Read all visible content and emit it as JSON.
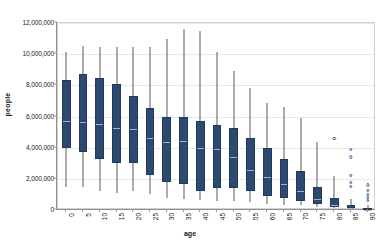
{
  "chart": {
    "type": "box",
    "title": "",
    "xlabel": "age",
    "ylabel": "people",
    "ylim": [
      0,
      12000000
    ],
    "ytick_labels": [
      "0",
      "2,000,000",
      "4,000,000",
      "6,000,000",
      "8,000,000",
      "10,000,000",
      "12,000,000"
    ],
    "ytick_values": [
      0,
      2000000,
      4000000,
      6000000,
      8000000,
      10000000,
      12000000
    ],
    "grid": true,
    "legend": "none",
    "box_color": "#2c4a70",
    "median_color": "#9fb2c8",
    "whisker_color": "#5b5b5b",
    "outlier_color": "#3a5f8a"
  },
  "chart_data": {
    "type": "box",
    "title": "",
    "xlabel": "age",
    "ylabel": "people",
    "ylim": [
      0,
      12000000
    ],
    "grid": true,
    "legend": "none",
    "categories": [
      "0",
      "5",
      "10",
      "15",
      "20",
      "25",
      "30",
      "35",
      "40",
      "45",
      "50",
      "55",
      "60",
      "65",
      "70",
      "75",
      "80",
      "85",
      "90"
    ],
    "boxes": [
      {
        "category": "0",
        "whisker_low": 1450000,
        "q1": 3950000,
        "median": 5750000,
        "q3": 8350000,
        "whisker_high": 10150000,
        "outliers": []
      },
      {
        "category": "5",
        "whisker_low": 1450000,
        "q1": 3700000,
        "median": 5700000,
        "q3": 8750000,
        "whisker_high": 10500000,
        "outliers": []
      },
      {
        "category": "10",
        "whisker_low": 1250000,
        "q1": 3300000,
        "median": 5600000,
        "q3": 8500000,
        "whisker_high": 10450000,
        "outliers": []
      },
      {
        "category": "15",
        "whisker_low": 1100000,
        "q1": 3000000,
        "median": 5300000,
        "q3": 8100000,
        "whisker_high": 10450000,
        "outliers": []
      },
      {
        "category": "20",
        "whisker_low": 1200000,
        "q1": 3000000,
        "median": 5250000,
        "q3": 7300000,
        "whisker_high": 10450000,
        "outliers": []
      },
      {
        "category": "25",
        "whisker_low": 1000000,
        "q1": 2250000,
        "median": 4700000,
        "q3": 6550000,
        "whisker_high": 10450000,
        "outliers": []
      },
      {
        "category": "30",
        "whisker_low": 800000,
        "q1": 1800000,
        "median": 4450000,
        "q3": 5950000,
        "whisker_high": 11000000,
        "outliers": []
      },
      {
        "category": "35",
        "whisker_low": 700000,
        "q1": 1650000,
        "median": 4500000,
        "q3": 6000000,
        "whisker_high": 11600000,
        "outliers": []
      },
      {
        "category": "40",
        "whisker_low": 650000,
        "q1": 1250000,
        "median": 4050000,
        "q3": 5700000,
        "whisker_high": 11500000,
        "outliers": []
      },
      {
        "category": "45",
        "whisker_low": 600000,
        "q1": 1400000,
        "median": 3950000,
        "q3": 5450000,
        "whisker_high": 10150000,
        "outliers": []
      },
      {
        "category": "50",
        "whisker_low": 550000,
        "q1": 1400000,
        "median": 3450000,
        "q3": 5250000,
        "whisker_high": 8900000,
        "outliers": []
      },
      {
        "category": "55",
        "whisker_low": 500000,
        "q1": 1200000,
        "median": 2650000,
        "q3": 4650000,
        "whisker_high": 7850000,
        "outliers": []
      },
      {
        "category": "60",
        "whisker_low": 400000,
        "q1": 900000,
        "median": 2200000,
        "q3": 4000000,
        "whisker_high": 6850000,
        "outliers": []
      },
      {
        "category": "65",
        "whisker_low": 350000,
        "q1": 750000,
        "median": 1750000,
        "q3": 3250000,
        "whisker_high": 6600000,
        "outliers": []
      },
      {
        "category": "70",
        "whisker_low": 300000,
        "q1": 600000,
        "median": 1300000,
        "q3": 2500000,
        "whisker_high": 5900000,
        "outliers": []
      },
      {
        "category": "75",
        "whisker_low": 200000,
        "q1": 400000,
        "median": 800000,
        "q3": 1450000,
        "whisker_high": 4350000,
        "outliers": []
      },
      {
        "category": "80",
        "whisker_low": 120000,
        "q1": 200000,
        "median": 400000,
        "q3": 750000,
        "whisker_high": 2200000,
        "outliers": [
          4600000
        ]
      },
      {
        "category": "85",
        "whisker_low": 60000,
        "q1": 100000,
        "median": 180000,
        "q3": 320000,
        "whisker_high": 700000,
        "outliers": [
          3900000,
          3400000,
          2200000,
          1750000,
          1500000
        ]
      },
      {
        "category": "90",
        "whisker_low": 20000,
        "q1": 50000,
        "median": 90000,
        "q3": 160000,
        "whisker_high": 330000,
        "outliers": [
          1600000,
          1250000,
          1000000,
          800000,
          620000
        ]
      }
    ]
  }
}
